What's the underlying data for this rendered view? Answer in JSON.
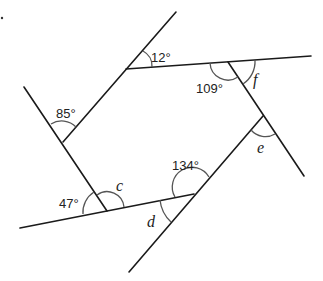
{
  "diagram": {
    "vertices": {
      "A": [
        126,
        69
      ],
      "B": [
        228,
        62
      ],
      "C": [
        263,
        116
      ],
      "D": [
        194,
        194
      ],
      "E": [
        107,
        211
      ],
      "F": [
        63,
        142
      ]
    },
    "angles": {
      "a12": "12°",
      "a109": "109°",
      "af": "f",
      "a85": "85°",
      "ae": "e",
      "a134": "134°",
      "ac": "c",
      "a47": "47°",
      "ad": "d"
    },
    "stroke_color": "#1a1a1a",
    "arc_color": "#555555"
  }
}
